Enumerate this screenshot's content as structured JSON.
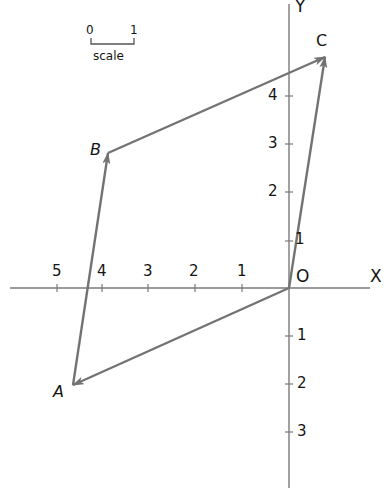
{
  "diagram": {
    "type": "vector parallelogram on coordinate axes",
    "colors": {
      "axis": "#7a7a7a",
      "vector": "#737373",
      "text": "#151515",
      "background": "#ffffff"
    },
    "scale": {
      "start_label": "0",
      "end_label": "1",
      "caption": "scale"
    },
    "axes": {
      "x_label": "X",
      "y_label": "Y",
      "origin_label": "O",
      "x_ticks": [
        "5",
        "4",
        "3",
        "2",
        "1"
      ],
      "y_ticks_positive": [
        "1",
        "2",
        "3",
        "4"
      ],
      "y_ticks_negative": [
        "1",
        "2",
        "3"
      ]
    },
    "points": {
      "A": {
        "label": "A",
        "x": -4.8,
        "y": -2.1
      },
      "B": {
        "label": "B",
        "x": -3.8,
        "y": 2.8
      },
      "C": {
        "label": "C",
        "x": 0.8,
        "y": 4.8
      },
      "O": {
        "label": "O",
        "x": 0,
        "y": 0
      }
    },
    "vectors": [
      {
        "name": "OA",
        "from": "O",
        "to": "A"
      },
      {
        "name": "AB",
        "from": "A",
        "to": "B"
      },
      {
        "name": "BC",
        "from": "B",
        "to": "C"
      },
      {
        "name": "OC",
        "from": "O",
        "to": "C"
      }
    ]
  }
}
